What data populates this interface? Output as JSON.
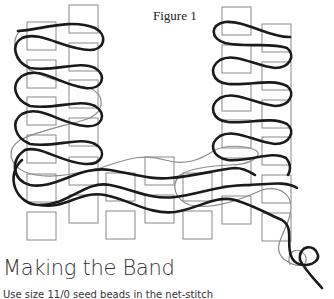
{
  "figure": {
    "title": "Figure 1",
    "bead_color": "#8a8a8a",
    "thread_primary_color": "#1a1a1a",
    "thread_secondary_color": "#8c8c8c",
    "beads": [
      {
        "x": 27,
        "y": 22
      },
      {
        "x": 27,
        "y": 60
      },
      {
        "x": 27,
        "y": 97
      },
      {
        "x": 27,
        "y": 135
      },
      {
        "x": 27,
        "y": 174
      },
      {
        "x": 27,
        "y": 212
      },
      {
        "x": 69,
        "y": 5
      },
      {
        "x": 69,
        "y": 43
      },
      {
        "x": 69,
        "y": 80
      },
      {
        "x": 69,
        "y": 118
      },
      {
        "x": 69,
        "y": 157
      },
      {
        "x": 69,
        "y": 195
      },
      {
        "x": 106,
        "y": 173
      },
      {
        "x": 106,
        "y": 211
      },
      {
        "x": 145,
        "y": 157
      },
      {
        "x": 145,
        "y": 195
      },
      {
        "x": 183,
        "y": 173
      },
      {
        "x": 183,
        "y": 211
      },
      {
        "x": 222,
        "y": 7
      },
      {
        "x": 222,
        "y": 45
      },
      {
        "x": 222,
        "y": 83
      },
      {
        "x": 222,
        "y": 120
      },
      {
        "x": 222,
        "y": 158
      },
      {
        "x": 222,
        "y": 196
      },
      {
        "x": 262,
        "y": 24
      },
      {
        "x": 262,
        "y": 62
      },
      {
        "x": 262,
        "y": 100
      },
      {
        "x": 262,
        "y": 137
      },
      {
        "x": 262,
        "y": 175
      },
      {
        "x": 262,
        "y": 213
      }
    ],
    "bead_width": 29,
    "bead_height": 28
  },
  "section": {
    "heading": "Making the Band",
    "body": "Use size 11/0 seed beads in the net-stitch"
  }
}
